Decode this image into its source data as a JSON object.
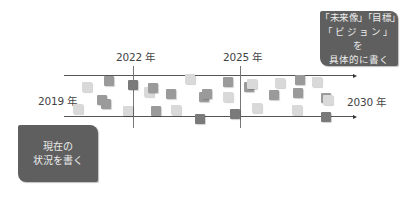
{
  "timeline": {
    "start_label": "2019 年",
    "end_label": "2030 年",
    "markers": [
      {
        "label": "2022 年",
        "x": 133
      },
      {
        "label": "2025 年",
        "x": 240
      }
    ]
  },
  "callouts": {
    "future": {
      "lines": [
        "「未来像」「目標」",
        "「ビジョン」を",
        "具体的に書く"
      ]
    },
    "present": {
      "lines": [
        "現在の",
        "状況を書く"
      ]
    }
  },
  "colors": {
    "box": "#5f5f5f",
    "box_text": "#ececec",
    "square_light": "#d9d9d9",
    "square_mid": "#9a9a9a",
    "square_dark": "#7a7a7a",
    "line": "#555555"
  },
  "squares": [
    {
      "x": 82,
      "y": 82,
      "tone": "light"
    },
    {
      "x": 73,
      "y": 104,
      "tone": "light"
    },
    {
      "x": 104,
      "y": 76,
      "tone": "mid"
    },
    {
      "x": 97,
      "y": 95,
      "tone": "mid"
    },
    {
      "x": 101,
      "y": 99,
      "tone": "mid"
    },
    {
      "x": 128,
      "y": 80,
      "tone": "dark"
    },
    {
      "x": 123,
      "y": 106,
      "tone": "light"
    },
    {
      "x": 144,
      "y": 87,
      "tone": "light"
    },
    {
      "x": 148,
      "y": 83,
      "tone": "mid"
    },
    {
      "x": 166,
      "y": 89,
      "tone": "mid"
    },
    {
      "x": 151,
      "y": 106,
      "tone": "mid"
    },
    {
      "x": 171,
      "y": 105,
      "tone": "light"
    },
    {
      "x": 185,
      "y": 74,
      "tone": "light"
    },
    {
      "x": 199,
      "y": 92,
      "tone": "mid"
    },
    {
      "x": 202,
      "y": 89,
      "tone": "mid"
    },
    {
      "x": 195,
      "y": 114,
      "tone": "dark"
    },
    {
      "x": 223,
      "y": 77,
      "tone": "mid"
    },
    {
      "x": 223,
      "y": 92,
      "tone": "light"
    },
    {
      "x": 230,
      "y": 109,
      "tone": "dark"
    },
    {
      "x": 244,
      "y": 82,
      "tone": "mid"
    },
    {
      "x": 247,
      "y": 79,
      "tone": "light"
    },
    {
      "x": 252,
      "y": 103,
      "tone": "light"
    },
    {
      "x": 275,
      "y": 78,
      "tone": "light"
    },
    {
      "x": 269,
      "y": 90,
      "tone": "mid"
    },
    {
      "x": 295,
      "y": 75,
      "tone": "mid"
    },
    {
      "x": 293,
      "y": 88,
      "tone": "mid"
    },
    {
      "x": 312,
      "y": 77,
      "tone": "light"
    },
    {
      "x": 292,
      "y": 105,
      "tone": "light"
    },
    {
      "x": 321,
      "y": 93,
      "tone": "mid"
    },
    {
      "x": 323,
      "y": 95,
      "tone": "light"
    },
    {
      "x": 321,
      "y": 112,
      "tone": "dark"
    }
  ]
}
